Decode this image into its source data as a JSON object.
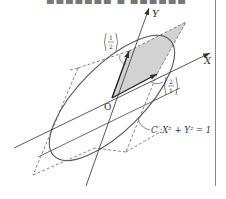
{
  "caption": {
    "text": "■■■■■■■ ■ ■■■■■■■■■■ ■■■■■■■"
  },
  "diagram": {
    "axis_x_label": "X",
    "axis_y_label": "Y",
    "origin_label": "O",
    "vector_a": {
      "top": "1",
      "bottom": "2"
    },
    "vector_b": {
      "top": "2",
      "bottom": "1"
    },
    "curve_label": "C′:X² + Y² = 1",
    "colors": {
      "line": "#444444",
      "shade": "#cfcfcf",
      "dashed": "#666666",
      "curve": "#555555"
    }
  }
}
